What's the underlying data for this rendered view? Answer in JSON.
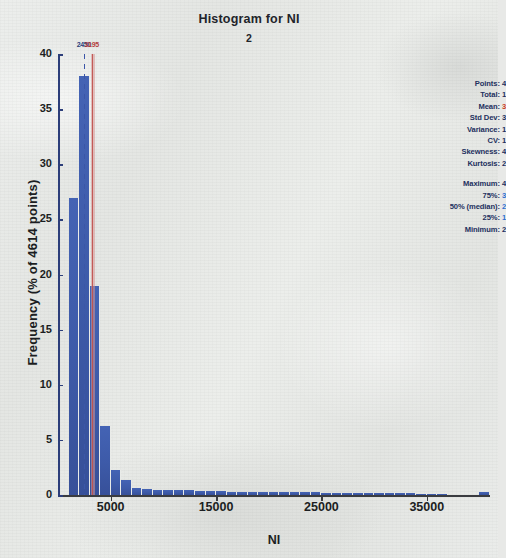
{
  "title": "Histogram for NI",
  "subtitle": "2",
  "axes": {
    "xlabel": "NI",
    "ylabel": "Frequency (% of 4614 points)",
    "yticks": [
      "40",
      "35",
      "30",
      "25",
      "20",
      "15",
      "10",
      "5",
      "0"
    ],
    "xticks": [
      "5000",
      "15000",
      "25000",
      "35000"
    ]
  },
  "markers": [
    {
      "name": "median-line",
      "label": "2450",
      "color": "#2c3e7a",
      "style": "dashed"
    },
    {
      "name": "mean-line",
      "label": "3195",
      "color": "#c0504d",
      "style": "solid"
    }
  ],
  "stats": {
    "points": {
      "label": "Points:",
      "value": "4"
    },
    "total": {
      "label": "Total:",
      "value": "1"
    },
    "mean": {
      "label": "Mean:",
      "value": "3"
    },
    "std_dev": {
      "label": "Std Dev:",
      "value": "3"
    },
    "variance": {
      "label": "Variance:",
      "value": "1"
    },
    "cv": {
      "label": "CV:",
      "value": "1"
    },
    "skewness": {
      "label": "Skewness:",
      "value": "4"
    },
    "kurtosis": {
      "label": "Kurtosis:",
      "value": "2"
    },
    "maximum": {
      "label": "Maximum:",
      "value": "4"
    },
    "p75": {
      "label": "75%:",
      "value": "3"
    },
    "median": {
      "label": "50% (median):",
      "value": "2"
    },
    "p25": {
      "label": "25%:",
      "value": "1"
    },
    "minimum": {
      "label": "Minimum:",
      "value": "2"
    }
  },
  "chart_data": {
    "type": "bar",
    "title": "Histogram for NI",
    "subtitle": "2",
    "xlabel": "NI",
    "ylabel": "Frequency (% of 4614 points)",
    "xlim": [
      0,
      41000
    ],
    "ylim": [
      0,
      40
    ],
    "grid": false,
    "legend": null,
    "bin_width": 1000,
    "bin_starts": [
      1000,
      2000,
      3000,
      4000,
      5000,
      6000,
      7000,
      8000,
      9000,
      10000,
      11000,
      12000,
      13000,
      14000,
      15000,
      16000,
      17000,
      18000,
      19000,
      20000,
      21000,
      22000,
      23000,
      24000,
      25000,
      26000,
      27000,
      28000,
      29000,
      30000,
      31000,
      32000,
      33000,
      34000,
      35000,
      36000,
      37000,
      38000,
      39000,
      40000
    ],
    "values": [
      26.9,
      38.0,
      19.0,
      6.3,
      2.3,
      1.4,
      0.6,
      0.55,
      0.5,
      0.5,
      0.45,
      0.45,
      0.4,
      0.4,
      0.35,
      0.3,
      0.3,
      0.3,
      0.3,
      0.28,
      0.28,
      0.25,
      0.25,
      0.25,
      0.22,
      0.22,
      0.2,
      0.2,
      0.2,
      0.2,
      0.18,
      0.18,
      0.15,
      0.12,
      0.1,
      0.1,
      0.0,
      0.0,
      0.0,
      0.3
    ],
    "markers": [
      {
        "name": "median",
        "x": 2450,
        "label": "2450",
        "color": "#2c3e7a"
      },
      {
        "name": "mean",
        "x": 3195,
        "label": "3195",
        "color": "#c0504d"
      }
    ],
    "ytick_values": [
      0,
      5,
      10,
      15,
      20,
      25,
      30,
      35,
      40
    ],
    "xtick_values": [
      5000,
      15000,
      25000,
      35000
    ],
    "bar_color": "#3d5aa8"
  }
}
